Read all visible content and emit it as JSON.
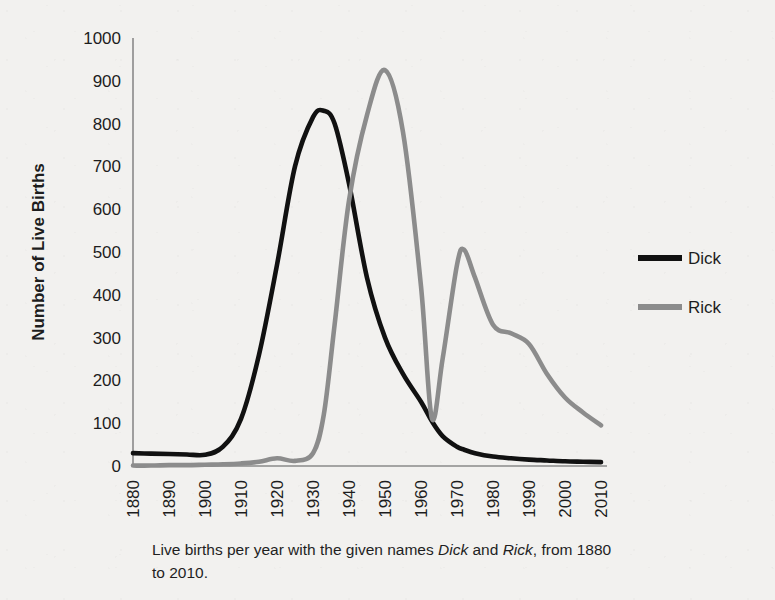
{
  "figure": {
    "y_axis_title": "Number of Live Births",
    "caption_line1_pre": "Live births per year with the given names ",
    "caption_name1": "Dick",
    "caption_mid": " and ",
    "caption_name2": "Rick",
    "caption_line1_post": ",",
    "caption_line2": "from 1880 to 2010."
  },
  "legend": {
    "position": "right",
    "items": [
      {
        "label": "Dick",
        "color": "#111111"
      },
      {
        "label": "Rick",
        "color": "#8c8c8c"
      }
    ]
  },
  "chart_data": {
    "type": "line",
    "title": "",
    "xlabel": "",
    "ylabel": "Number of Live Births",
    "xlim": [
      1880,
      2010
    ],
    "ylim": [
      0,
      1000
    ],
    "grid": false,
    "legend_position": "right",
    "x_ticks": [
      1880,
      1890,
      1900,
      1910,
      1920,
      1930,
      1940,
      1950,
      1960,
      1970,
      1980,
      1990,
      2000,
      2010
    ],
    "y_ticks": [
      0,
      100,
      200,
      300,
      400,
      500,
      600,
      700,
      800,
      900,
      1000
    ],
    "x": [
      1880,
      1885,
      1890,
      1895,
      1900,
      1905,
      1910,
      1915,
      1920,
      1925,
      1930,
      1933,
      1936,
      1940,
      1945,
      1950,
      1955,
      1960,
      1963,
      1966,
      1970,
      1972,
      1975,
      1980,
      1985,
      1990,
      1995,
      2000,
      2005,
      2010
    ],
    "series": [
      {
        "name": "Dick",
        "color": "#111111",
        "values": [
          30,
          29,
          28,
          27,
          26,
          45,
          110,
          260,
          470,
          700,
          815,
          830,
          800,
          660,
          440,
          300,
          215,
          150,
          105,
          70,
          45,
          38,
          30,
          22,
          18,
          15,
          13,
          11,
          10,
          9
        ]
      },
      {
        "name": "Rick",
        "color": "#8c8c8c",
        "values": [
          1,
          1,
          2,
          2,
          3,
          4,
          6,
          10,
          18,
          12,
          30,
          120,
          330,
          620,
          820,
          925,
          780,
          420,
          112,
          250,
          470,
          505,
          440,
          330,
          310,
          285,
          215,
          160,
          125,
          95
        ]
      }
    ],
    "annotations": {
      "dick_peak": {
        "year": 1933,
        "value": 830
      },
      "rick_peak": {
        "year": 1950,
        "value": 925
      },
      "rick_dip": {
        "year": 1963,
        "value": 112
      },
      "rick_second_peak": {
        "year": 1972,
        "value": 505
      }
    }
  }
}
